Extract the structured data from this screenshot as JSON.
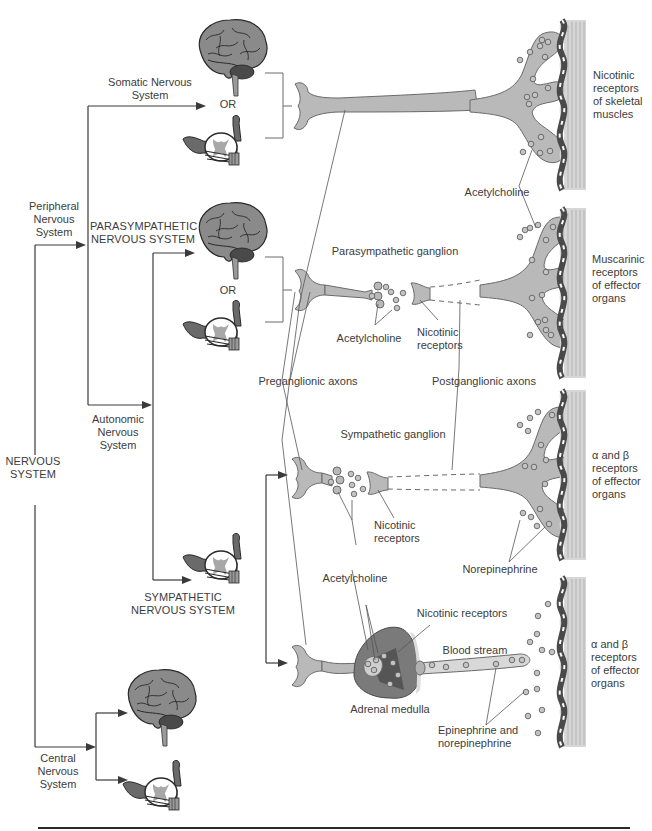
{
  "diagram": {
    "root": {
      "label": "NERVOUS\nSYSTEM"
    },
    "divisions": {
      "peripheral": {
        "label": "Peripheral\nNervous\nSystem"
      },
      "central": {
        "label": "Central\nNervous\nSystem"
      },
      "somatic": {
        "label": "Somatic Nervous\nSystem"
      },
      "autonomic": {
        "label": "Autonomic\nNervous\nSystem"
      },
      "parasympathetic": {
        "label": "PARASYMPATHETIC\nNERVOUS SYSTEM"
      },
      "sympathetic": {
        "label": "SYMPATHETIC\nNERVOUS SYSTEM"
      }
    },
    "or_labels": {
      "somatic": "OR",
      "parasympathetic": "OR"
    },
    "pathway_labels": {
      "preganglionic_axons": "Preganglionic axons",
      "postganglionic_axons": "Postganglionic axons",
      "parasympathetic_ganglion": "Parasympathetic ganglion",
      "sympathetic_ganglion": "Sympathetic ganglion",
      "acetylcholine_somatic": "Acetylcholine",
      "acetylcholine_parasympathetic": "Acetylcholine",
      "nicotinic_receptors_parasympathetic": "Nicotinic\nreceptors",
      "acetylcholine_sympathetic": "Acetylcholine",
      "nicotinic_receptors_sympathetic": "Nicotinic\nreceptors",
      "norepinephrine": "Norepinephrine",
      "nicotinic_receptors_adrenal": "Nicotinic receptors",
      "blood_stream": "Blood stream",
      "adrenal_medulla": "Adrenal medulla",
      "epinephrine_norepinephrine": "Epinephrine and\nnorepinephrine"
    },
    "target_labels": {
      "skeletal": "Nicotinic\nreceptors\nof skeletal\nmuscles",
      "muscarinic": "Muscarinic\nreceptors\nof effector\norgans",
      "sympathetic_effector": "α and β\nreceptors\nof effector\norgans",
      "adrenal_effector": "α and β\nreceptors\nof effector\norgans"
    },
    "colors": {
      "neuron_fill": "#b9b9b9",
      "neuron_stroke": "#6a6a6a",
      "muscle_fill": "#d4d4d4",
      "membrane_dark": "#555555",
      "line": "#3a3a3a",
      "adrenal_outer": "#7a7a7a",
      "adrenal_inner": "#555555"
    }
  }
}
